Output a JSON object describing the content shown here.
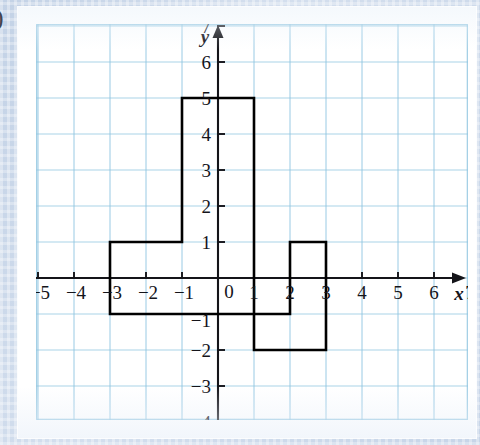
{
  "page": {
    "edge_glyph": ")",
    "background_color": "#ccd8ea",
    "paper_color": "#ffffff"
  },
  "grid": {
    "line_color": "#8ec4e0",
    "cell_px": 36,
    "axis_color": "#141419",
    "shape_color": "#000000"
  },
  "axes": {
    "x_label": "x",
    "y_label": "y",
    "origin_label": "0",
    "x_ticks": [
      "−5",
      "−4",
      "−3",
      "−2",
      "−1",
      "1",
      "2",
      "3",
      "4",
      "5",
      "6",
      "7"
    ],
    "y_ticks": [
      "7",
      "6",
      "5",
      "4",
      "3",
      "2",
      "1",
      "−1",
      "−2",
      "−3",
      "−4"
    ]
  },
  "chart_data": {
    "type": "line",
    "title": "",
    "xlabel": "x",
    "ylabel": "y",
    "grid": true,
    "legend": "none",
    "xlim": [
      -6,
      8
    ],
    "ylim": [
      -5,
      8
    ],
    "xticks": [
      -5,
      -4,
      -3,
      -2,
      -1,
      0,
      1,
      2,
      3,
      4,
      5,
      6,
      7
    ],
    "yticks": [
      -4,
      -3,
      -2,
      -1,
      0,
      1,
      2,
      3,
      4,
      5,
      6,
      7
    ],
    "series": [
      {
        "name": "closed polygon",
        "closed": true,
        "points": [
          [
            -1,
            5
          ],
          [
            1,
            5
          ],
          [
            1,
            -2
          ],
          [
            3,
            -2
          ],
          [
            3,
            1
          ],
          [
            2,
            1
          ],
          [
            2,
            -1
          ],
          [
            -3,
            -1
          ],
          [
            -3,
            1
          ],
          [
            -1,
            1
          ]
        ]
      }
    ]
  }
}
